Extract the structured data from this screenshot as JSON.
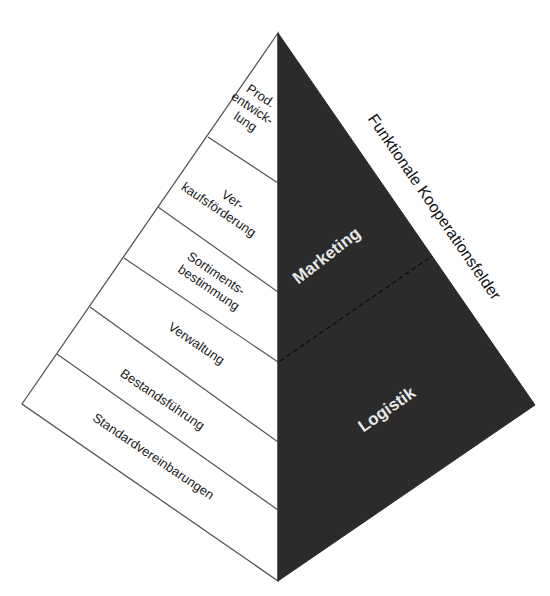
{
  "diagram": {
    "type": "pyramid",
    "colors": {
      "background": "#ffffff",
      "left_face": "#ffffff",
      "right_face": "#2b2b2b",
      "outline": "#555555",
      "label_dark": "#1a1a1a",
      "label_light": "#e8e8e8"
    },
    "left_face_levels": [
      {
        "lines": [
          "Prod.",
          "entwick-",
          "lung"
        ]
      },
      {
        "lines": [
          "Ver-",
          "kaufsförderung"
        ]
      },
      {
        "lines": [
          "Sortiments-",
          "bestimmung"
        ]
      },
      {
        "lines": [
          "Verwaltung"
        ]
      },
      {
        "lines": [
          "Bestandsführung"
        ]
      },
      {
        "lines": [
          "Standardvereinbarungen"
        ]
      }
    ],
    "right_face_areas": {
      "upper": "Marketing",
      "lower": "Logistik"
    },
    "side_label": "Funktionale Kooperationsfelder"
  }
}
